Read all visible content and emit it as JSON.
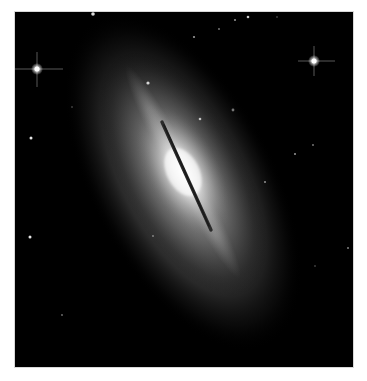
{
  "image": {
    "subject": "edge-on lenticular galaxy with thin dust lane",
    "alt": "Grayscale telescope image of an elongated spindle-shaped galaxy tilted diagonally, bright core with a dark dust lane, surrounded by foreground stars",
    "colors": {
      "background": "#000000",
      "border": "#ffffff",
      "core": "#ffffff",
      "halo": "#9a9a9a",
      "dust_lane": "#2a2a2a"
    }
  }
}
